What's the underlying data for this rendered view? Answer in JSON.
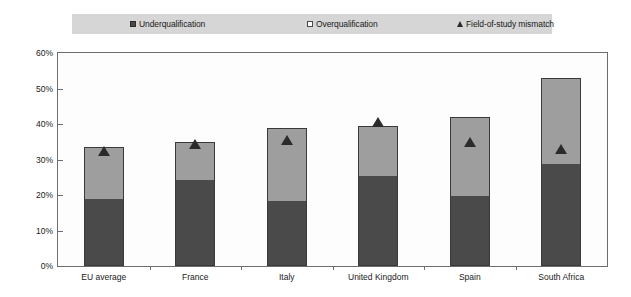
{
  "chart_data": {
    "type": "bar",
    "subtype": "stacked-bar-with-marker",
    "title": "",
    "xlabel": "",
    "ylabel": "",
    "ylim": [
      0,
      60
    ],
    "ytick_labels": [
      "0%",
      "10%",
      "20%",
      "30%",
      "40%",
      "50%",
      "60%"
    ],
    "ytick_values": [
      0,
      10,
      20,
      30,
      40,
      50,
      60
    ],
    "grid": false,
    "legend_position": "top",
    "categories": [
      "EU average",
      "France",
      "Italy",
      "United Kingdom",
      "Spain",
      "South Africa"
    ],
    "series": [
      {
        "name": "Underqualification",
        "type": "bar-segment",
        "color": "#4a4a4a",
        "values": [
          18.5,
          24.0,
          18.0,
          25.0,
          19.5,
          28.5
        ]
      },
      {
        "name": "Overqualification",
        "type": "bar-segment",
        "color": "#9e9e9e",
        "values": [
          15.0,
          11.0,
          21.0,
          14.5,
          22.5,
          24.5
        ]
      },
      {
        "name": "Field-of-study mismatch",
        "type": "marker-triangle",
        "color": "#2b2b2b",
        "values": [
          32.5,
          34.5,
          35.5,
          40.5,
          35.0,
          33.0
        ]
      }
    ],
    "stack_totals": [
      33.5,
      35.0,
      39.0,
      39.5,
      42.0,
      53.0
    ]
  },
  "legend": {
    "items": [
      {
        "label": "Underqualification",
        "icon": "filled-square-swatch"
      },
      {
        "label": "Overqualification",
        "icon": "hollow-square-swatch"
      },
      {
        "label": "Field-of-study mismatch",
        "icon": "triangle-marker"
      }
    ]
  },
  "colors": {
    "underqualification": "#4a4a4a",
    "overqualification": "#9e9e9e",
    "mismatch_marker": "#2b2b2b",
    "legend_background": "#d6d6d6",
    "plot_border": "#6d6d6d",
    "plot_background": "#fdfdfd"
  }
}
